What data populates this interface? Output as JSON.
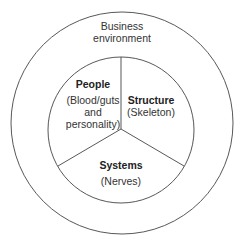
{
  "diagram": {
    "outer": {
      "label_lines": [
        "Business",
        "environment"
      ]
    },
    "segments": [
      {
        "id": "people",
        "title": "People",
        "subtitle_lines": [
          "(Blood/guts",
          "and",
          "personality)"
        ]
      },
      {
        "id": "structure",
        "title": "Structure",
        "subtitle_lines": [
          "(Skeleton)"
        ]
      },
      {
        "id": "systems",
        "title": "Systems",
        "subtitle_lines": [
          "(Nerves)"
        ]
      }
    ],
    "colors": {
      "stroke": "#444444",
      "text": "#222222",
      "background": "#ffffff"
    }
  }
}
